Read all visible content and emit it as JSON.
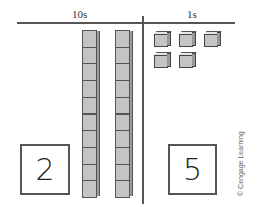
{
  "headers": {
    "tens": "10s",
    "ones": "1s"
  },
  "tens": {
    "rods": 2,
    "units_per_rod": 10,
    "digit": "2"
  },
  "ones": {
    "cubes": 5,
    "digit": "5"
  },
  "credit": "© Cengage Learning",
  "colors": {
    "block_face": "#c4c4c4",
    "block_side": "#9a9a9a",
    "lines": "#555555"
  }
}
